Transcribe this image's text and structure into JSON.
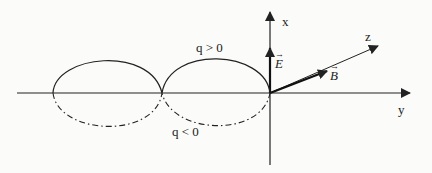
{
  "diagram": {
    "axes": {
      "x_label": "x",
      "y_label": "y",
      "z_label": "z"
    },
    "vectors": {
      "E_label": "E",
      "B_label": "B"
    },
    "curves": {
      "positive_label": "q > 0",
      "negative_label": "q < 0"
    },
    "colors": {
      "ink": "#222222",
      "background": "#fbfbf9"
    }
  }
}
